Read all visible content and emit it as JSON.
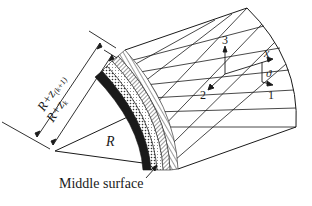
{
  "figure": {
    "labels": {
      "outer_radius": "R+z",
      "outer_radius_sub": "(k+1)",
      "inner_radius": "R+z",
      "inner_radius_sub": "k",
      "radius": "R",
      "middle_surface": "Middle surface",
      "axis_1": "1",
      "axis_2": "2",
      "axis_3": "3",
      "axis_x": "x",
      "angle": "ϑ"
    },
    "layers": [
      {
        "name": "layer-1",
        "pattern": "solid-dark"
      },
      {
        "name": "layer-2",
        "pattern": "dotted"
      },
      {
        "name": "layer-3",
        "pattern": "dotted-light"
      },
      {
        "name": "layer-4",
        "pattern": "diagonal-hatch"
      },
      {
        "name": "layer-5",
        "pattern": "radial-hatch"
      }
    ],
    "colors": {
      "line": "#1a1a1a",
      "background": "#ffffff"
    }
  }
}
